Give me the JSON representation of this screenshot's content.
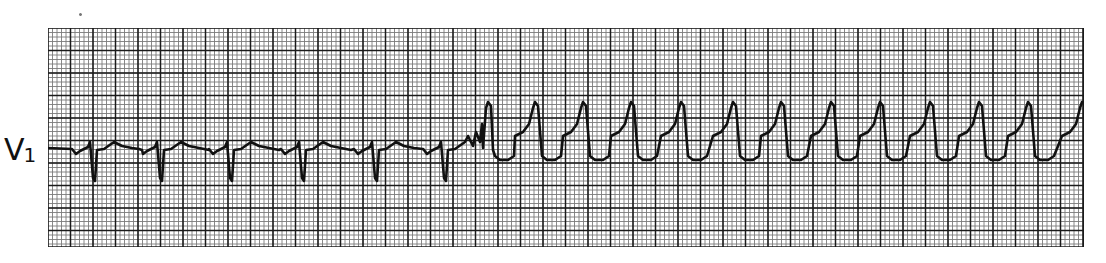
{
  "lead": {
    "letter": "V",
    "number": "1"
  },
  "colors": {
    "trace": "#111111",
    "grid_minor": "#7a7a7a",
    "grid_major": "#1a1a1a",
    "paper": "#ffffff"
  },
  "chart_data": {
    "type": "line",
    "title": "",
    "lead": "V1",
    "xlabel": "",
    "ylabel": "",
    "grid": true,
    "grid_spacing_px": {
      "minor": 4.5,
      "major": 22.5
    },
    "annotations": [
      "V1"
    ],
    "segments": [
      {
        "name": "narrow-complex rhythm",
        "beats": 8,
        "qrs_morphology": "rS",
        "x_range_px": [
          0,
          440
        ]
      },
      {
        "name": "wide-complex tachycardia",
        "beats": 13,
        "qrs_morphology": "monophasic R",
        "x_range_px": [
          440,
          1036
        ]
      }
    ],
    "narrow_beat_x_px": [
      44,
      111,
      181,
      253,
      326,
      395
    ],
    "wide_beat_peak_x_px": [
      440,
      487,
      535,
      583,
      633,
      685,
      733,
      783,
      832,
      882,
      931,
      980,
      1034
    ]
  }
}
